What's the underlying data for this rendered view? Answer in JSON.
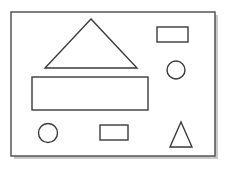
{
  "figure": {
    "canvas": {
      "width": 230,
      "height": 169
    },
    "colors": {
      "page_background": "#ffffff",
      "frame_fill": "#ffffff",
      "stroke": "#3a3a3a",
      "frame_stroke": "#4a4a4a",
      "shadow": "#c9c9c9"
    },
    "stroke_width": 1.4,
    "frame": {
      "name": "outer-frame",
      "x": 11,
      "y": 12,
      "width": 204,
      "height": 144,
      "shadow_offset": 3
    },
    "shapes": [
      {
        "id": "large-triangle",
        "label": "Large triangle",
        "type": "triangle",
        "points": "91,19 137,68 45,68",
        "apex": {
          "x": 91,
          "y": 19
        },
        "base_left": {
          "x": 45,
          "y": 68
        },
        "base_right": {
          "x": 137,
          "y": 68
        },
        "base_width": 92,
        "height": 49
      },
      {
        "id": "large-rectangle",
        "label": "Large rectangle",
        "type": "rectangle",
        "x": 32,
        "y": 77,
        "width": 116,
        "height": 33
      },
      {
        "id": "top-right-rectangle",
        "label": "Small rectangle top right",
        "type": "rectangle",
        "x": 157,
        "y": 27,
        "width": 31,
        "height": 15
      },
      {
        "id": "right-circle",
        "label": "Circle right",
        "type": "circle",
        "cx": 176,
        "cy": 70,
        "r": 9
      },
      {
        "id": "bottom-left-circle",
        "label": "Circle bottom left",
        "type": "circle",
        "cx": 48,
        "cy": 133,
        "r": 9.5
      },
      {
        "id": "bottom-middle-rectangle",
        "label": "Small rectangle bottom middle",
        "type": "rectangle",
        "x": 100,
        "y": 125,
        "width": 28,
        "height": 15
      },
      {
        "id": "bottom-right-triangle",
        "label": "Small triangle bottom right",
        "type": "triangle",
        "points": "181,122 192,147 170,147",
        "apex": {
          "x": 181,
          "y": 122
        },
        "base_left": {
          "x": 170,
          "y": 147
        },
        "base_right": {
          "x": 192,
          "y": 147
        },
        "base_width": 22,
        "height": 25
      }
    ],
    "shape_counts": {
      "triangles": 2,
      "rectangles": 3,
      "circles": 2,
      "total": 7
    }
  }
}
